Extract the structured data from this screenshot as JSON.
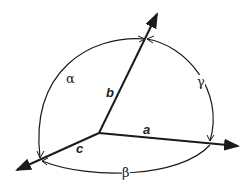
{
  "diagram": {
    "axes": [
      {
        "name": "a",
        "label": "a"
      },
      {
        "name": "b",
        "label": "b"
      },
      {
        "name": "c",
        "label": "c"
      }
    ],
    "angles": [
      {
        "name": "alpha",
        "label": "α",
        "between": "b-c"
      },
      {
        "name": "beta",
        "label": "β",
        "between": "a-c"
      },
      {
        "name": "gamma",
        "label": "γ",
        "between": "a-b"
      }
    ],
    "colors": {
      "line": "#1a1a1a",
      "background": "#ffffff"
    }
  }
}
